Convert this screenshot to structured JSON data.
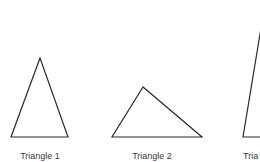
{
  "triangles": [
    {
      "label": "Triangle 1",
      "points": "40,58 11,137 68,137",
      "label_x": 40
    },
    {
      "label": "Triangle 2",
      "points": "143,87 112,137 202,137",
      "label_x": 152
    },
    {
      "label": "Tria",
      "points": "262,22 243,137 290,137",
      "label_x": 252
    }
  ],
  "stroke_color": "#2b2b2b"
}
